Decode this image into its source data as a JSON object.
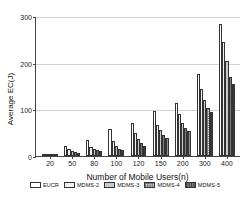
{
  "chart_data": {
    "type": "bar",
    "title": "",
    "xlabel": "Number of Mobile Users(n)",
    "ylabel": "Average EC(J)",
    "categories": [
      "20",
      "50",
      "80",
      "100",
      "120",
      "150",
      "200",
      "300",
      "400"
    ],
    "ylim": [
      0,
      300
    ],
    "yticks": [
      0,
      100,
      200,
      300
    ],
    "grid": true,
    "legend_position": "bottom",
    "series": [
      {
        "name": "EUCR",
        "values": [
          5,
          21,
          35,
          57,
          70,
          96,
          114,
          175,
          283
        ]
      },
      {
        "name": "MDMS-2",
        "values": [
          4,
          15,
          20,
          32,
          49,
          67,
          89,
          143,
          244
        ]
      },
      {
        "name": "MDMS-3",
        "values": [
          3,
          11,
          15,
          22,
          36,
          55,
          71,
          119,
          203
        ]
      },
      {
        "name": "MDMS-4",
        "values": [
          2,
          8,
          12,
          16,
          27,
          46,
          59,
          103,
          170
        ]
      },
      {
        "name": "MDMS-5",
        "values": [
          2,
          6,
          10,
          13,
          22,
          38,
          54,
          95,
          155
        ]
      }
    ]
  },
  "axis": {
    "y_tick_labels": [
      "0",
      "100",
      "200",
      "300"
    ]
  },
  "legend": {
    "items": [
      {
        "label": "EUCR",
        "pattern": "white-fill"
      },
      {
        "label": "MDMS-2",
        "pattern": "dotted-fill"
      },
      {
        "label": "MDMS-3",
        "pattern": "gray-fill"
      },
      {
        "label": "MDMS-4",
        "pattern": "checkered-fill"
      },
      {
        "label": "MDMS-5",
        "pattern": "vertical-stripe-fill"
      }
    ]
  }
}
